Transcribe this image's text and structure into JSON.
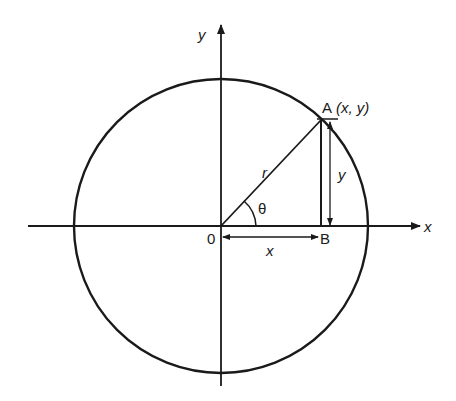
{
  "diagram": {
    "type": "unit-circle-trig",
    "axes": {
      "x_label": "x",
      "y_label": "y"
    },
    "origin_label": "0",
    "point_a_label": "A",
    "point_a_coords": "(x, y)",
    "point_b_label": "B",
    "radius_label": "r",
    "angle_label": "θ",
    "horizontal_segment_label": "x",
    "vertical_segment_label": "y",
    "colors": {
      "ink": "#1a1a1a",
      "background": "#ffffff"
    }
  }
}
